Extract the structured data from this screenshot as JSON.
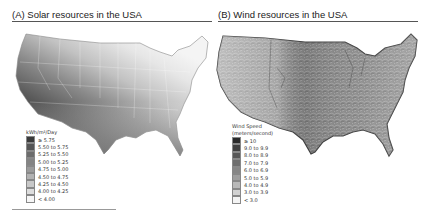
{
  "panels": [
    {
      "id": "A",
      "title": "(A) Solar resources in the USA",
      "legend": {
        "title": "kWh/m²/Day",
        "items": [
          {
            "label": "≥ 5.75",
            "color": "#3a3a3a"
          },
          {
            "label": "5.50 to 5.75",
            "color": "#555555"
          },
          {
            "label": "5.25 to 5.50",
            "color": "#6c6c6c"
          },
          {
            "label": "5.00 to 5.25",
            "color": "#848484"
          },
          {
            "label": "4.75 to 5.00",
            "color": "#9b9b9b"
          },
          {
            "label": "4.50 to 4.75",
            "color": "#b2b2b2"
          },
          {
            "label": "4.25 to 4.50",
            "color": "#c8c8c8"
          },
          {
            "label": "4.00 to 4.25",
            "color": "#dddddd"
          },
          {
            "label": "< 4.00",
            "color": "#f6f6f6"
          }
        ]
      }
    },
    {
      "id": "B",
      "title": "(B) Wind resources in the USA",
      "legend": {
        "title_line1": "Wind Speed",
        "title_line2": "(meters/second)",
        "items": [
          {
            "label": "≥ 10",
            "color": "#2a2a2a"
          },
          {
            "label": "9.0 to 9.9",
            "color": "#404040"
          },
          {
            "label": "8.0 to 8.9",
            "color": "#575757"
          },
          {
            "label": "7.0 to 7.9",
            "color": "#6e6e6e"
          },
          {
            "label": "6.0 to 6.9",
            "color": "#868686"
          },
          {
            "label": "5.0 to 5.9",
            "color": "#9e9e9e"
          },
          {
            "label": "4.0 to 4.9",
            "color": "#b8b8b8"
          },
          {
            "label": "3.0 to 3.9",
            "color": "#d2d2d2"
          },
          {
            "label": "< 3.0",
            "color": "#f4f4f4"
          }
        ]
      }
    }
  ]
}
